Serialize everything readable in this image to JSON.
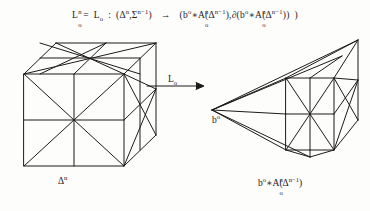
{
  "figure": {
    "kind": "mathematical-diagram",
    "background_color": "#fdfdfc",
    "ink_color": "#1d1b19"
  },
  "formula": {
    "lhs_base": "L",
    "lhs_sup": "n",
    "lhs_sub": "o",
    "equals": "=",
    "mid_base": "L",
    "mid_sub": "o",
    "colon": ":",
    "open_paren_1": "(",
    "delta_base": "Δ",
    "delta_sup": "n",
    "comma_1": ",",
    "sigma_base": "Σ",
    "sigma_sup": "n−1",
    "close_paren_1": ")",
    "arrow": "→",
    "open_paren_2": "(",
    "b_base": "b",
    "b_sup": "o",
    "star": "∗",
    "A_base": "A",
    "A_sup": "n",
    "A_sub": "o",
    "open_paren_3": "(",
    "delta2_base": "Δ",
    "delta2_sup": "n−1",
    "close_paren_3": ")",
    "comma_2": ",",
    "boundary": "∂",
    "open_paren_4": "(",
    "b2_base": "b",
    "b2_sup": "o",
    "star_2": "∗",
    "A2_base": "A",
    "A2_sup": "n",
    "A2_sub": "o",
    "open_paren_5": "(",
    "delta3_base": "Δ",
    "delta3_sup": "n−1",
    "close_paren_5": ")",
    "close_paren_4": ")",
    "close_paren_2": ")",
    "plain_text": "Lₒⁿ = Lₒ : (Δⁿ, Σⁿ⁻¹) → (bᵒ ∗ Aₒⁿ(Δⁿ⁻¹), ∂(bᵒ ∗ Aₒⁿ(Δⁿ⁻¹)))"
  },
  "map_arrow": {
    "label_base": "L",
    "label_sub": "o",
    "direction": "right"
  },
  "left_figure": {
    "name": "triangulated-cube",
    "caption_base": "Δ",
    "caption_sup": "n",
    "caption_plain": "Δⁿ"
  },
  "right_figure": {
    "name": "triangulated-cone",
    "apex_base": "b",
    "apex_sup": "o",
    "apex_plain": "bᵒ",
    "caption_b": "b",
    "caption_b_sup": "o",
    "caption_star": "∗",
    "caption_A": "A",
    "caption_A_sup": "n",
    "caption_A_sub": "o",
    "caption_open": "(",
    "caption_delta": "Δ",
    "caption_delta_sup": "n−1",
    "caption_close": ")",
    "caption_plain": "bᵒ∗Aₒⁿ(Δⁿ⁻¹)"
  }
}
